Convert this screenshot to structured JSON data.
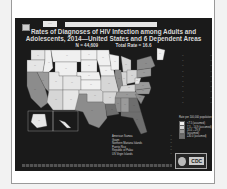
{
  "slide": {
    "tag_short": "····",
    "tag_long": null,
    "title": "Rates of Diagnoses of HIV Infection among Adults and Adolescents, 2014—United States and 6 Dependent Areas",
    "n_label": "N = 44,609",
    "total_rate_label": "Total Rate = 16.6",
    "footnote": null,
    "logo": "CDC"
  },
  "map": {
    "illegible_placeholder": "··",
    "note": "State-level rate values are not legible at this resolution; each value is null and renders as the placeholder.",
    "states": [
      {
        "id": "WA",
        "rate": null,
        "shade": "#e6e6e6"
      },
      {
        "id": "OR",
        "rate": null,
        "shade": "#e6e6e6"
      },
      {
        "id": "CA",
        "rate": null,
        "shade": "#8c8c8c"
      },
      {
        "id": "NV",
        "rate": null,
        "shade": "#9a9a9a"
      },
      {
        "id": "ID",
        "rate": null,
        "shade": "#f0f0f0"
      },
      {
        "id": "MT",
        "rate": null,
        "shade": "#f0f0f0"
      },
      {
        "id": "WY",
        "rate": null,
        "shade": "#f0f0f0"
      },
      {
        "id": "UT",
        "rate": null,
        "shade": "#e6e6e6"
      },
      {
        "id": "AZ",
        "rate": null,
        "shade": "#d6d6d6"
      },
      {
        "id": "CO",
        "rate": null,
        "shade": "#e6e6e6"
      },
      {
        "id": "NM",
        "rate": null,
        "shade": "#e6e6e6"
      },
      {
        "id": "ND",
        "rate": null,
        "shade": "#f0f0f0"
      },
      {
        "id": "SD",
        "rate": null,
        "shade": "#f0f0f0"
      },
      {
        "id": "NE",
        "rate": null,
        "shade": "#f0f0f0"
      },
      {
        "id": "KS",
        "rate": null,
        "shade": "#f0f0f0"
      },
      {
        "id": "OK",
        "rate": null,
        "shade": "#d6d6d6"
      },
      {
        "id": "TX",
        "rate": null,
        "shade": "#8c8c8c"
      },
      {
        "id": "MN",
        "rate": null,
        "shade": "#f0f0f0"
      },
      {
        "id": "IA",
        "rate": null,
        "shade": "#f0f0f0"
      },
      {
        "id": "MO",
        "rate": null,
        "shade": "#d6d6d6"
      },
      {
        "id": "AR",
        "rate": null,
        "shade": "#d6d6d6"
      },
      {
        "id": "LA",
        "rate": null,
        "shade": "#6e6e6e"
      },
      {
        "id": "WI",
        "rate": null,
        "shade": "#f0f0f0"
      },
      {
        "id": "IL",
        "rate": null,
        "shade": "#8c8c8c"
      },
      {
        "id": "MI",
        "rate": null,
        "shade": "#d6d6d6"
      },
      {
        "id": "IN",
        "rate": null,
        "shade": "#d6d6d6"
      },
      {
        "id": "OH",
        "rate": null,
        "shade": "#d6d6d6"
      },
      {
        "id": "KY",
        "rate": null,
        "shade": "#d6d6d6"
      },
      {
        "id": "TN",
        "rate": null,
        "shade": "#9a9a9a"
      },
      {
        "id": "MS",
        "rate": null,
        "shade": "#8c8c8c"
      },
      {
        "id": "AL",
        "rate": null,
        "shade": "#9a9a9a"
      },
      {
        "id": "GA",
        "rate": null,
        "shade": "#6e6e6e"
      },
      {
        "id": "FL",
        "rate": null,
        "shade": "#6e6e6e"
      },
      {
        "id": "SC",
        "rate": null,
        "shade": "#8c8c8c"
      },
      {
        "id": "NC",
        "rate": null,
        "shade": "#9a9a9a"
      },
      {
        "id": "VA",
        "rate": null,
        "shade": "#9a9a9a"
      },
      {
        "id": "WV",
        "rate": null,
        "shade": "#e6e6e6"
      },
      {
        "id": "PA",
        "rate": null,
        "shade": "#9a9a9a"
      },
      {
        "id": "NY",
        "rate": null,
        "shade": "#8c8c8c"
      },
      {
        "id": "ME",
        "rate": null,
        "shade": "#f0f0f0"
      },
      {
        "id": "AK",
        "rate": null,
        "shade": "#e6e6e6"
      },
      {
        "id": "HI",
        "rate": null,
        "shade": "#e6e6e6"
      }
    ],
    "callouts": [
      {
        "state": null,
        "rate": null
      },
      {
        "state": null,
        "rate": null
      },
      {
        "state": null,
        "rate": null
      },
      {
        "state": null,
        "rate": null
      },
      {
        "state": null,
        "rate": null
      },
      {
        "state": null,
        "rate": null
      },
      {
        "state": null,
        "rate": null
      },
      {
        "state": null,
        "rate": null
      },
      {
        "state": null,
        "rate": null
      },
      {
        "state": null,
        "rate": null
      }
    ]
  },
  "legend": {
    "title": "Rate per 100,000 population",
    "items_note": "Range boundaries are not legible in the screenshot; these are the conventional CDC buckets for this series, included as an assumption.",
    "items": [
      {
        "label": "<7.5 (assumed)",
        "color": "#f0f0f0"
      },
      {
        "label": "7.5 – 14.9 (assumed)",
        "color": "#d6d6d6"
      },
      {
        "label": "15.0 – 29.9 (assumed)",
        "color": "#9a9a9a"
      },
      {
        "label": "≥30.0 (assumed)",
        "color": "#6e6e6e"
      }
    ]
  },
  "territories": [
    {
      "name": "American Samoa",
      "rate": null
    },
    {
      "name": "Guam",
      "rate": null
    },
    {
      "name": "Northern Mariana Islands",
      "rate": null
    },
    {
      "name": "Puerto Rico",
      "rate": null
    },
    {
      "name": "Republic of Palau",
      "rate": null
    },
    {
      "name": "US Virgin Islands",
      "rate": null
    }
  ]
}
